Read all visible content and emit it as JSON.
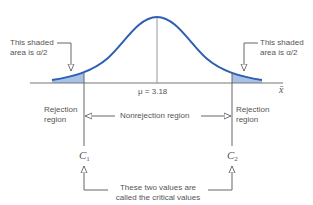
{
  "diagram": {
    "colors": {
      "curve": "#2e5fb3",
      "shade": "#a8c1e6",
      "lines": "#555555",
      "text": "#555555"
    },
    "axis_label": "x̄",
    "mean_label": "μ = 3.18",
    "left_tail_note": {
      "line1": "This shaded",
      "line2": "area is α/2"
    },
    "right_tail_note": {
      "line1": "This shaded",
      "line2": "area is α/2"
    },
    "left_region": {
      "line1": "Rejection",
      "line2": "region"
    },
    "right_region": {
      "line1": "Rejection",
      "line2": "region"
    },
    "middle_region": "Nonrejection region",
    "critical_left": {
      "symbol": "C",
      "sub": "1"
    },
    "critical_right": {
      "symbol": "C",
      "sub": "2"
    },
    "critical_note": {
      "line1": "These two values are",
      "line2": "called the critical values"
    }
  }
}
